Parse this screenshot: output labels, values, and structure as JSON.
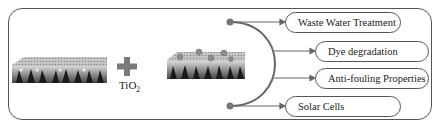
{
  "diagram": {
    "additive": {
      "label": "TiO",
      "subscript": "2"
    },
    "operator_icon": "plus-icon",
    "applications": [
      {
        "label": "Waste Water Treatment"
      },
      {
        "label": "Dye degradation"
      },
      {
        "label": "Anti-fouling Properties"
      },
      {
        "label": "Solar Cells"
      }
    ],
    "colors": {
      "stroke": "#555555",
      "plus": "#7a7a7a",
      "particle": "#8c8c8c"
    }
  }
}
